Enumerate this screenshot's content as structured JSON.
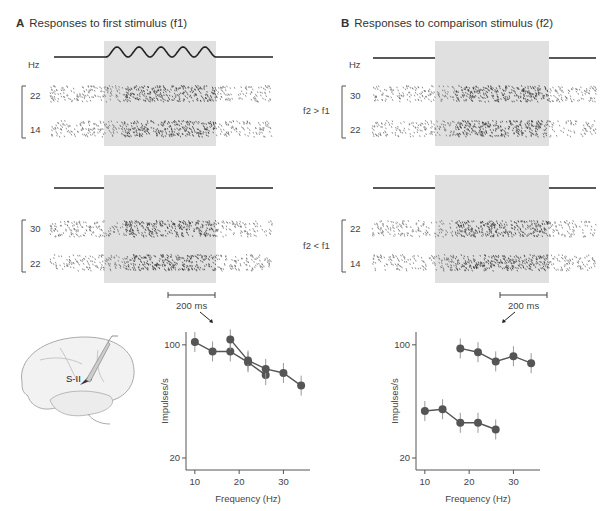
{
  "panelA": {
    "letter": "A",
    "title": "Responses to first stimulus (f1)",
    "hz_label": "Hz",
    "top_group": {
      "labels": [
        "22",
        "14"
      ],
      "stimulus_cycles": 5
    },
    "bottom_group": {
      "labels": [
        "30",
        "22"
      ],
      "stimulus_cycles": 8
    },
    "scale_bar": "200 ms"
  },
  "panelB": {
    "letter": "B",
    "title": "Responses to comparison stimulus (f2)",
    "hz_label": "Hz",
    "top_group": {
      "condition": "f2 > f1",
      "labels": [
        "30",
        "22"
      ],
      "stimulus_cycles": 8
    },
    "bottom_group": {
      "condition": "f2 < f1",
      "labels": [
        "22",
        "14"
      ],
      "stimulus_cycles": 5
    },
    "scale_bar": "200 ms"
  },
  "brain": {
    "region_label": "S-II"
  },
  "chart_data": [
    {
      "type": "line",
      "panel": "A",
      "xlabel": "Frequency (Hz)",
      "ylabel": "Impulses/s",
      "yscale": "log",
      "xlim": [
        8,
        36
      ],
      "ylim": [
        20,
        120
      ],
      "xticks": [
        10,
        20,
        30
      ],
      "yticks": [
        20,
        100
      ],
      "series": [
        {
          "name": "f1 responses (set 1)",
          "x": [
            10,
            14,
            18,
            22,
            26
          ],
          "y": [
            104,
            91,
            91,
            78,
            65
          ]
        },
        {
          "name": "f1 responses (set 2)",
          "x": [
            18,
            22,
            26,
            30,
            34
          ],
          "y": [
            108,
            80,
            71,
            67,
            56
          ]
        }
      ]
    },
    {
      "type": "line",
      "panel": "B",
      "xlabel": "Frequency (Hz)",
      "ylabel": "Impulses/s",
      "yscale": "log",
      "xlim": [
        8,
        36
      ],
      "ylim": [
        20,
        120
      ],
      "xticks": [
        10,
        20,
        30
      ],
      "yticks": [
        20,
        100
      ],
      "series": [
        {
          "name": "f2 > f1",
          "x": [
            18,
            22,
            26,
            30,
            34
          ],
          "y": [
            95,
            90,
            79,
            85,
            77
          ]
        },
        {
          "name": "f2 < f1",
          "x": [
            10,
            14,
            18,
            22,
            26
          ],
          "y": [
            39,
            40,
            33,
            33,
            30
          ]
        }
      ]
    }
  ]
}
